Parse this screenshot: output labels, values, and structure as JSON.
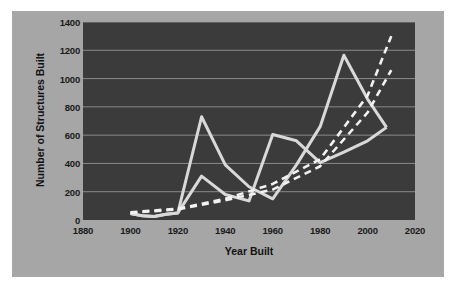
{
  "chart_data": {
    "type": "line",
    "title": "",
    "xlabel": "Year Built",
    "ylabel": "Number of Structures Built",
    "xlim": [
      1880,
      2020
    ],
    "ylim": [
      0,
      1400
    ],
    "xticks": [
      1880,
      1900,
      1920,
      1940,
      1960,
      1980,
      2000,
      2020
    ],
    "yticks": [
      0,
      200,
      400,
      600,
      800,
      1000,
      1200,
      1400
    ],
    "grid": "horizontal",
    "legend": "none",
    "plot_background": "#3b3b3b",
    "panel_background": "#a6a6a6",
    "series": [
      {
        "name": "series-1-solid-upper",
        "style": "solid",
        "color": "#d9d9d9",
        "x": [
          1900,
          1905,
          1910,
          1915,
          1920,
          1930,
          1940,
          1950,
          1960,
          1970,
          1980,
          1990,
          2000,
          2008
        ],
        "values": [
          45,
          30,
          25,
          40,
          50,
          730,
          390,
          235,
          150,
          390,
          660,
          1165,
          855,
          655
        ]
      },
      {
        "name": "series-2-solid-lower",
        "style": "solid",
        "color": "#d9d9d9",
        "x": [
          1900,
          1905,
          1910,
          1915,
          1920,
          1930,
          1940,
          1950,
          1960,
          1970,
          1980,
          1990,
          2000,
          2008
        ],
        "values": [
          45,
          30,
          25,
          40,
          50,
          310,
          180,
          135,
          605,
          560,
          405,
          480,
          560,
          655
        ]
      },
      {
        "name": "trend-1-dashed",
        "style": "dashed",
        "color": "#f2f2f2",
        "x": [
          1900,
          1920,
          1940,
          1960,
          1980,
          2000,
          2010
        ],
        "values": [
          55,
          80,
          150,
          255,
          430,
          880,
          1300
        ]
      },
      {
        "name": "trend-2-dashed",
        "style": "dashed",
        "color": "#f2f2f2",
        "x": [
          1900,
          1920,
          1940,
          1960,
          1980,
          2000,
          2010
        ],
        "values": [
          50,
          75,
          140,
          215,
          380,
          760,
          1060
        ]
      }
    ]
  },
  "axis": {
    "y_title": "Number of Structures Built",
    "x_title": "Year Built"
  }
}
